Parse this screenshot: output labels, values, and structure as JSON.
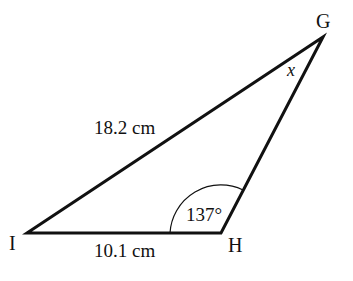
{
  "diagram": {
    "type": "triangle",
    "vertices": [
      {
        "label": "G",
        "x": 323,
        "y": 37
      },
      {
        "label": "H",
        "x": 221,
        "y": 233
      },
      {
        "label": "I",
        "x": 27,
        "y": 233
      }
    ],
    "sides": [
      {
        "between": "IG",
        "label": "18.2 cm"
      },
      {
        "between": "IH",
        "label": "10.1 cm"
      }
    ],
    "angles": [
      {
        "at": "H",
        "label": "137°"
      },
      {
        "at": "G",
        "label": "x"
      }
    ],
    "line_color": "#111111"
  }
}
